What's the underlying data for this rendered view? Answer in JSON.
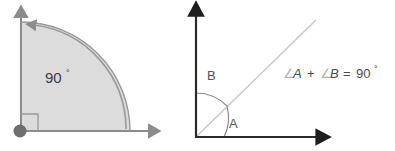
{
  "figure": {
    "background_color": "#ffffff"
  },
  "left_diagram": {
    "name": "right-angle-sector",
    "angle_label": "90",
    "degree_symbol": "°",
    "sector_fill_color": "#dcdcdc",
    "sector_stroke_color": "#9a9a9a",
    "axis_color": "#8c8c8c",
    "vertex_dot_color": "#6e6e6e",
    "right_angle_marker_color": "#9a9a9a",
    "vertical_axis": "arrow-up",
    "horizontal_axis": "arrow-right",
    "arc_arrow": "arrow-left"
  },
  "right_diagram": {
    "name": "two-complementary-angles",
    "axis_color": "#2b2b2b",
    "ray_color": "#c8c8c8",
    "arc_color": "#8c8c8c",
    "angle_a_label": "A",
    "angle_b_label": "B",
    "vertical_axis": "arrow-up",
    "horizontal_axis": "arrow-right",
    "equation": {
      "angle_symbol": "∠",
      "term_a": "A",
      "plus": "+",
      "term_b": "B",
      "equals": "=",
      "value": "90",
      "degree_symbol": "°",
      "full_text": "∠A + ∠B = 90°"
    }
  }
}
